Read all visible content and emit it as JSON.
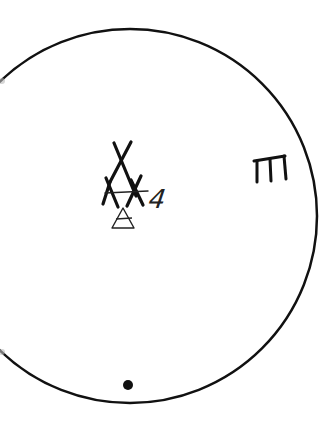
{
  "diagram": {
    "type": "hand-drawn symbol diagram",
    "circle": {
      "cx": 130,
      "cy": 216,
      "r": 187,
      "stroke": "#111111",
      "stroke_width": 2.5,
      "clipped_left_edge": true
    },
    "symbols": [
      {
        "id": "teepee-cross-symbol",
        "description": "stacked crossed lines forming an A/teepee shape with a horizontal bar",
        "position": [
          122,
          180
        ]
      },
      {
        "id": "small-triangle-symbol",
        "description": "small triangle with inner line below the teepee",
        "position": [
          123,
          219
        ]
      },
      {
        "id": "number-label",
        "text": "4",
        "position": [
          157,
          200
        ]
      },
      {
        "id": "comb-glyph-symbol",
        "description": "hand-drawn glyph resembling a three-pronged 'm' / comb shape",
        "position": [
          270,
          165
        ]
      },
      {
        "id": "dot-marker",
        "description": "solid black dot near bottom of circle",
        "position": [
          128,
          385
        ]
      }
    ],
    "colors": {
      "ink": "#111111",
      "background": "#ffffff"
    }
  },
  "labels": {
    "number": "4"
  }
}
